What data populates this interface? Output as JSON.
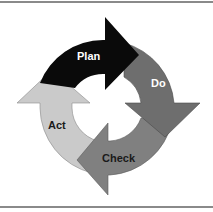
{
  "diagram": {
    "type": "cycle",
    "stages": [
      {
        "label": "Plan",
        "color": "#0a0a0a",
        "text_color": "#ffffff"
      },
      {
        "label": "Do",
        "color": "#6e6e6e",
        "text_color": "#ffffff"
      },
      {
        "label": "Check",
        "color": "#808080",
        "text_color": "#1a1a1a"
      },
      {
        "label": "Act",
        "color": "#cacaca",
        "text_color": "#1a1a1a"
      }
    ]
  }
}
